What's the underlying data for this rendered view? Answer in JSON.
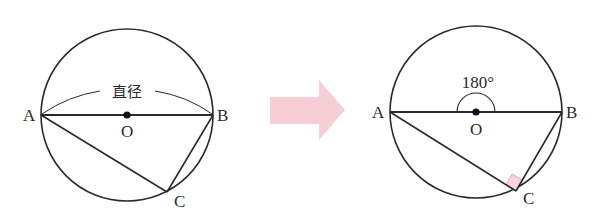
{
  "left_figure": {
    "points": {
      "A": "A",
      "B": "B",
      "C": "C",
      "O": "O"
    },
    "diameter_label": "直径"
  },
  "right_figure": {
    "points": {
      "A": "A",
      "B": "B",
      "C": "C",
      "O": "O"
    },
    "angle_label": "180°"
  },
  "colors": {
    "line": "#2a2a2a",
    "arrow": "#f4c9d2",
    "right_angle_fill": "#f7d6dd",
    "right_angle_stroke": "#e48a9e"
  }
}
